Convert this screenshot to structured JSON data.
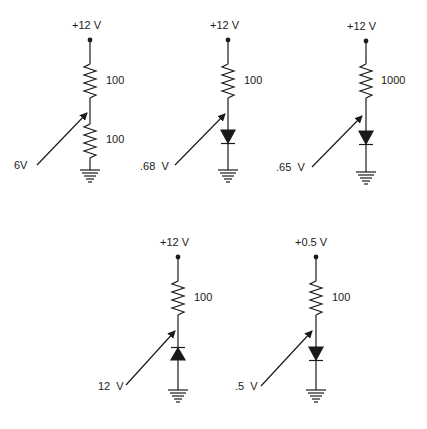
{
  "circuits": [
    {
      "id": "c1",
      "supply": "+12 V",
      "components": [
        {
          "type": "resistor",
          "value": "100"
        },
        {
          "type": "resistor",
          "value": "100"
        }
      ],
      "probe_label": "6V"
    },
    {
      "id": "c2",
      "supply": "+12 V",
      "components": [
        {
          "type": "resistor",
          "value": "100"
        },
        {
          "type": "diode",
          "orientation": "forward"
        }
      ],
      "probe_label": ".68  V"
    },
    {
      "id": "c3",
      "supply": "+12 V",
      "components": [
        {
          "type": "resistor",
          "value": "1000"
        },
        {
          "type": "diode",
          "orientation": "forward"
        }
      ],
      "probe_label": ".65  V"
    },
    {
      "id": "c4",
      "supply": "+12 V",
      "components": [
        {
          "type": "resistor",
          "value": "100"
        },
        {
          "type": "diode",
          "orientation": "reverse"
        }
      ],
      "probe_label": "12  V"
    },
    {
      "id": "c5",
      "supply": "+0.5 V",
      "components": [
        {
          "type": "resistor",
          "value": "100"
        },
        {
          "type": "diode",
          "orientation": "forward"
        }
      ],
      "probe_label": ".5  V"
    }
  ],
  "colors": {
    "ink": "#1a1a1a",
    "background": "#ffffff"
  },
  "caption": "Figure: voltage dividers and diode circuits"
}
